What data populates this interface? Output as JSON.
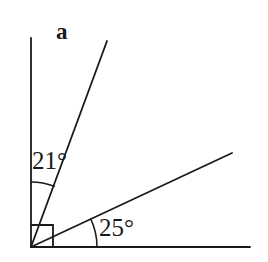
{
  "figure": {
    "label": "a",
    "background_color": "#ffffff",
    "stroke_color": "#1a1a1a",
    "vertex": {
      "x": 31,
      "y": 247
    },
    "rays": [
      {
        "name": "vertical-ray",
        "description": "vertical ray pointing up from vertex",
        "from": {
          "x": 31,
          "y": 247
        },
        "to": {
          "x": 31,
          "y": 38
        }
      },
      {
        "name": "steep-ray",
        "description": "ray at 21 degrees from the vertical ray",
        "from": {
          "x": 31,
          "y": 247
        },
        "to": {
          "x": 107,
          "y": 41
        }
      },
      {
        "name": "middle-ray",
        "description": "ray at 25 degrees above the horizontal baseline",
        "from": {
          "x": 31,
          "y": 247
        },
        "to": {
          "x": 232,
          "y": 153
        }
      },
      {
        "name": "horizontal-baseline",
        "description": "horizontal ray pointing right from vertex",
        "from": {
          "x": 31,
          "y": 247
        },
        "to": {
          "x": 250,
          "y": 247
        }
      }
    ],
    "angles": [
      {
        "name": "angle-21",
        "label": "21°",
        "value": 21,
        "unit": "degrees",
        "between": [
          "vertical-ray",
          "steep-ray"
        ],
        "arc_radius": 65
      },
      {
        "name": "angle-25",
        "label": "25°",
        "value": 25,
        "unit": "degrees",
        "between": [
          "horizontal-baseline",
          "middle-ray"
        ],
        "arc_radius": 66
      }
    ],
    "right_angle_marker": {
      "name": "right-angle-marker",
      "description": "square marker indicating 90 degrees between vertical ray and horizontal baseline",
      "size": 22
    }
  }
}
